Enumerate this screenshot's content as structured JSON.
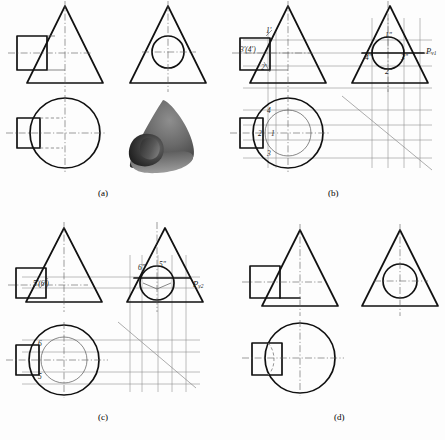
{
  "figure": {
    "background_color": "#fdfdfd",
    "outline_color": "#111111",
    "construction_color": "#888888",
    "center_line_color": "#555555",
    "hidden_line_color": "#777777"
  },
  "panels": [
    {
      "id": "a",
      "caption": "(a)",
      "description": "Given three views and pictorial of cone with cylindrical hole",
      "views": [
        "front-view",
        "side-view",
        "top-view",
        "pictorial-view"
      ],
      "labels": []
    },
    {
      "id": "b",
      "caption": "(b)",
      "description": "Construction of points 1, 2, 3, 4 using auxiliary cutting plane",
      "views": [
        "front-view",
        "side-view",
        "top-view"
      ],
      "labels": [
        {
          "text": "1'",
          "view": "front",
          "x": 268,
          "y": 32
        },
        {
          "text": "3'(4')",
          "view": "front",
          "x": 243,
          "y": 51
        },
        {
          "text": "2'",
          "view": "front",
          "x": 263,
          "y": 69
        },
        {
          "text": "1\"",
          "view": "side",
          "x": 387,
          "y": 37
        },
        {
          "text": "4\"",
          "view": "side",
          "x": 368,
          "y": 58
        },
        {
          "text": "3\"",
          "view": "side",
          "x": 403,
          "y": 58
        },
        {
          "text": "2\"",
          "view": "side",
          "x": 387,
          "y": 72
        },
        {
          "text": "4",
          "view": "top",
          "x": 268,
          "y": 112
        },
        {
          "text": "1",
          "view": "top",
          "x": 271,
          "y": 135
        },
        {
          "text": "2",
          "view": "top",
          "x": 260,
          "y": 135
        },
        {
          "text": "3",
          "view": "top",
          "x": 268,
          "y": 155
        }
      ],
      "plane_label": {
        "text": "P",
        "subscript": "v1",
        "x": 423,
        "y": 52
      }
    },
    {
      "id": "c",
      "caption": "(c)",
      "description": "Construction of points 5 and 6 using second auxiliary cutting plane",
      "views": [
        "front-view",
        "side-view",
        "top-view"
      ],
      "labels": [
        {
          "text": "5'(6')",
          "view": "front",
          "x": 37,
          "y": 285
        },
        {
          "text": "6\"",
          "view": "side",
          "x": 142,
          "y": 270
        },
        {
          "text": "5\"",
          "view": "side",
          "x": 162,
          "y": 267
        },
        {
          "text": "6",
          "view": "top",
          "x": 40,
          "y": 345
        },
        {
          "text": "5",
          "view": "top",
          "x": 40,
          "y": 378
        }
      ],
      "plane_label": {
        "text": "P",
        "subscript": "v2",
        "x": 190,
        "y": 285
      }
    },
    {
      "id": "d",
      "caption": "(d)",
      "description": "Completed views with intersection curve",
      "views": [
        "front-view",
        "side-view",
        "top-view"
      ],
      "labels": []
    }
  ]
}
